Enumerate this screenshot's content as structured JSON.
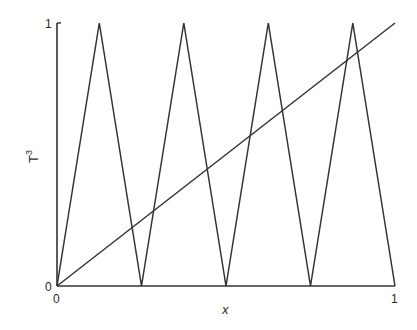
{
  "chart_data": {
    "type": "line",
    "title": "",
    "xlabel": "x",
    "ylabel": "T",
    "ylabel_superscript": "3",
    "xlim": [
      0,
      1
    ],
    "ylim": [
      0,
      1
    ],
    "grid": false,
    "x_ticks": [
      "0",
      "1"
    ],
    "y_ticks": [
      "0",
      "1"
    ],
    "series": [
      {
        "name": "T^3 (tent map, 3rd iterate)",
        "x": [
          0,
          0.125,
          0.25,
          0.375,
          0.5,
          0.625,
          0.75,
          0.875,
          1
        ],
        "y": [
          0,
          1,
          0,
          1,
          0,
          1,
          0,
          1,
          0
        ]
      },
      {
        "name": "y = x (diagonal)",
        "x": [
          0,
          1
        ],
        "y": [
          0,
          1
        ]
      }
    ]
  },
  "labels": {
    "x_tick_0": "0",
    "x_tick_1": "1",
    "y_tick_0": "0",
    "y_tick_1": "1",
    "xlabel": "x",
    "ylabel": "T",
    "ylabel_sup": "3"
  }
}
